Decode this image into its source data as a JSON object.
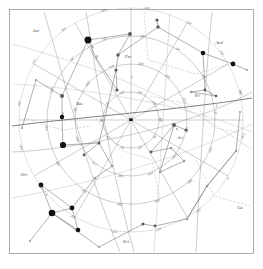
{
  "chart_data": {
    "type": "scatter",
    "subtitle": "",
    "xlabel": "",
    "ylabel": "",
    "projection": "polar-equidistant",
    "grid": true,
    "legend_position": "none",
    "background_color": "#ffffff",
    "line_color": "#6f6f6f",
    "grid_color": "#8f8f8f",
    "star_color": "#111111",
    "label_color": "#3d3d3d",
    "center": {
      "x": 131,
      "y": 120,
      "label": "·"
    },
    "declination_circles": [
      {
        "radius": 28,
        "label": "60°"
      },
      {
        "radius": 56,
        "label": "40°"
      },
      {
        "radius": 84,
        "label": "20°"
      },
      {
        "radius": 112,
        "label": "0°"
      }
    ],
    "hour_lines_count": 12,
    "ra_tick_labels": [
      "0h",
      "2h",
      "4h",
      "6h",
      "8h",
      "10h",
      "12h",
      "14h",
      "16h",
      "18h",
      "20h",
      "22h"
    ],
    "coordinate_labels": [
      "60°",
      "50°",
      "40°",
      "30°",
      "20°",
      "10°",
      "0°",
      "100°",
      "110°",
      "120°",
      "130°",
      "140°",
      "150°",
      "160°",
      "170°",
      "180°",
      "190°",
      "200°",
      "210°",
      "220°",
      "240°",
      "250°",
      "260°",
      "280°",
      "290°",
      "300°",
      "310°",
      "320°",
      "330°",
      "340°"
    ],
    "constellations": [
      {
        "abbr": "Aur",
        "name": "Auriga",
        "x": 36,
        "y": 32
      },
      {
        "abbr": "Per",
        "name": "Perseus",
        "x": 128,
        "y": 58
      },
      {
        "abbr": "And",
        "name": "Andromeda",
        "x": 219,
        "y": 44
      },
      {
        "abbr": "Tri",
        "name": "Triangulum",
        "x": 197,
        "y": 97
      },
      {
        "abbr": "Ari",
        "name": "Aries",
        "x": 180,
        "y": 139
      },
      {
        "abbr": "Tau",
        "name": "Taurus",
        "x": 79,
        "y": 105
      },
      {
        "abbr": "Ori",
        "name": "Orion",
        "x": 24,
        "y": 176
      },
      {
        "abbr": "Eri",
        "name": "Eridanus",
        "x": 126,
        "y": 243
      },
      {
        "abbr": "Ce",
        "name": "Cetus",
        "x": 240,
        "y": 209
      }
    ],
    "greek_letters": [
      {
        "glyph": "α",
        "x": 92,
        "y": 48
      },
      {
        "glyph": "β",
        "x": 96,
        "y": 58
      },
      {
        "glyph": "γ",
        "x": 131,
        "y": 78
      },
      {
        "glyph": "δ",
        "x": 62,
        "y": 115
      },
      {
        "glyph": "ε",
        "x": 46,
        "y": 196
      },
      {
        "glyph": "ζ",
        "x": 216,
        "y": 107
      },
      {
        "glyph": "η",
        "x": 176,
        "y": 130
      }
    ],
    "stars": [
      {
        "x": 88,
        "y": 40,
        "mag": 0.1,
        "r": 3.4
      },
      {
        "x": 63,
        "y": 145,
        "mag": 0.9,
        "r": 3.1
      },
      {
        "x": 52,
        "y": 213,
        "mag": 0.2,
        "r": 3.3
      },
      {
        "x": 72,
        "y": 208,
        "mag": 1.6,
        "r": 2.4
      },
      {
        "x": 78,
        "y": 230,
        "mag": 1.7,
        "r": 2.3
      },
      {
        "x": 41,
        "y": 185,
        "mag": 1.6,
        "r": 2.4
      },
      {
        "x": 62,
        "y": 117,
        "mag": 1.8,
        "r": 2.2
      },
      {
        "x": 203,
        "y": 53,
        "mag": 2.1,
        "r": 2.3
      },
      {
        "x": 233,
        "y": 64,
        "mag": 2.1,
        "r": 2.4
      },
      {
        "x": 62,
        "y": 96,
        "mag": 2.6,
        "r": 2.0
      },
      {
        "x": 130,
        "y": 34,
        "mag": 2.8,
        "r": 1.9
      },
      {
        "x": 158,
        "y": 27,
        "mag": 2.9,
        "r": 1.7
      },
      {
        "x": 157,
        "y": 20,
        "mag": 3.0,
        "r": 1.6
      },
      {
        "x": 118,
        "y": 55,
        "mag": 3.0,
        "r": 1.7
      },
      {
        "x": 116,
        "y": 70,
        "mag": 3.1,
        "r": 1.6
      },
      {
        "x": 117,
        "y": 90,
        "mag": 3.2,
        "r": 1.6
      },
      {
        "x": 174,
        "y": 125,
        "mag": 2.6,
        "r": 2.0
      },
      {
        "x": 186,
        "y": 130,
        "mag": 3.2,
        "r": 1.6
      },
      {
        "x": 151,
        "y": 152,
        "mag": 3.6,
        "r": 1.4
      },
      {
        "x": 171,
        "y": 148,
        "mag": 3.7,
        "r": 1.3
      },
      {
        "x": 184,
        "y": 161,
        "mag": 3.8,
        "r": 1.3
      },
      {
        "x": 160,
        "y": 172,
        "mag": 3.9,
        "r": 1.2
      },
      {
        "x": 205,
        "y": 90,
        "mag": 3.5,
        "r": 1.4
      },
      {
        "x": 216,
        "y": 96,
        "mag": 3.6,
        "r": 1.3
      },
      {
        "x": 191,
        "y": 92,
        "mag": 3.7,
        "r": 1.3
      },
      {
        "x": 99,
        "y": 143,
        "mag": 3.4,
        "r": 1.5
      },
      {
        "x": 84,
        "y": 155,
        "mag": 3.6,
        "r": 1.4
      },
      {
        "x": 112,
        "y": 166,
        "mag": 3.8,
        "r": 1.3
      },
      {
        "x": 95,
        "y": 178,
        "mag": 3.9,
        "r": 1.2
      },
      {
        "x": 143,
        "y": 224,
        "mag": 3.3,
        "r": 1.6
      },
      {
        "x": 155,
        "y": 226,
        "mag": 3.6,
        "r": 1.4
      },
      {
        "x": 187,
        "y": 219,
        "mag": 3.8,
        "r": 1.3
      },
      {
        "x": 207,
        "y": 186,
        "mag": 3.7,
        "r": 1.3
      },
      {
        "x": 236,
        "y": 151,
        "mag": 3.9,
        "r": 1.2
      },
      {
        "x": 36,
        "y": 80,
        "mag": 4.0,
        "r": 1.1
      },
      {
        "x": 22,
        "y": 128,
        "mag": 4.1,
        "r": 1.1
      },
      {
        "x": 30,
        "y": 241,
        "mag": 4.0,
        "r": 1.1
      },
      {
        "x": 99,
        "y": 247,
        "mag": 4.1,
        "r": 1.0
      },
      {
        "x": 240,
        "y": 112,
        "mag": 4.0,
        "r": 1.1
      },
      {
        "x": 247,
        "y": 70,
        "mag": 4.2,
        "r": 1.0
      }
    ]
  }
}
